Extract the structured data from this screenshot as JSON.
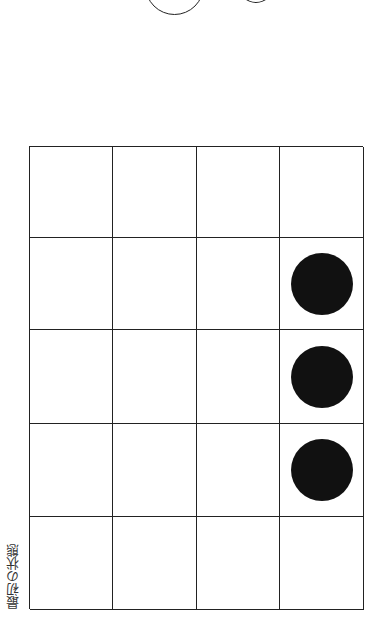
{
  "caption": "最初の状態",
  "grid": {
    "columns": 4,
    "rows": 5,
    "pieces": [
      {
        "row": 1,
        "col": 3,
        "color": "black"
      },
      {
        "row": 2,
        "col": 3,
        "color": "black"
      },
      {
        "row": 3,
        "col": 3,
        "color": "black"
      }
    ]
  },
  "top_circles": [
    {
      "style": "outline",
      "partial": true
    },
    {
      "style": "outline",
      "partial": true
    }
  ],
  "colors": {
    "line": "#222222",
    "piece": "#111111",
    "background": "#ffffff"
  }
}
